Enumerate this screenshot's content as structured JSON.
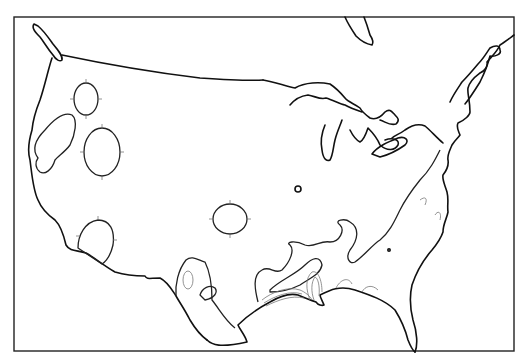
{
  "map": {
    "type": "contour-map",
    "region": "contiguous-united-states",
    "frame_color": "#222222",
    "coast_color": "#111111",
    "contour_color": "#222222",
    "inner_contour_color": "#777777",
    "labels": []
  }
}
